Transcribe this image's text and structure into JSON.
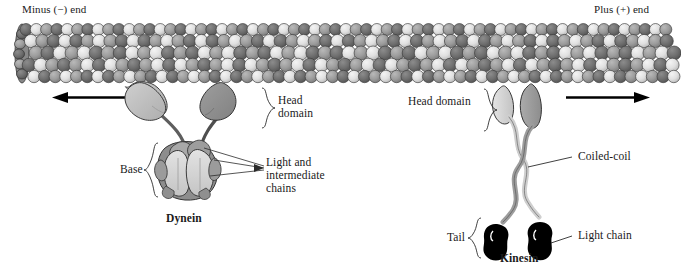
{
  "diagram": {
    "polarity": {
      "minus_end": "Minus (−) end",
      "plus_end": "Plus (+) end"
    },
    "colors": {
      "tubulin_light": "#e2e2e2",
      "tubulin_mid": "#9a9a9a",
      "tubulin_dark": "#6d6d6d",
      "outline": "#2b2b2b",
      "dynein_head_light": "#bdbdbd",
      "dynein_head_dark": "#8f8f8f",
      "dynein_base_light": "#d6d6d6",
      "dynein_base_dark": "#8a8a8a",
      "kinesin_light": "#d8d8d8",
      "kinesin_dark": "#9d9d9d",
      "light_chain": "#000000",
      "arrow": "#000000",
      "text": "#1a1a1a"
    },
    "dynein": {
      "name": "Dynein",
      "head_domain": "Head\ndomain",
      "head_domain_line1": "Head",
      "head_domain_line2": "domain",
      "base": "Base",
      "chains": "Light and\nintermediate\nchains",
      "chains_line1": "Light and",
      "chains_line2": "intermediate",
      "chains_line3": "chains",
      "direction": "toward minus end"
    },
    "kinesin": {
      "name": "Kinesin",
      "head_domain": "Head domain",
      "coiled_coil": "Coiled-coil",
      "tail": "Tail",
      "light_chain": "Light chain",
      "direction": "toward plus end"
    }
  }
}
